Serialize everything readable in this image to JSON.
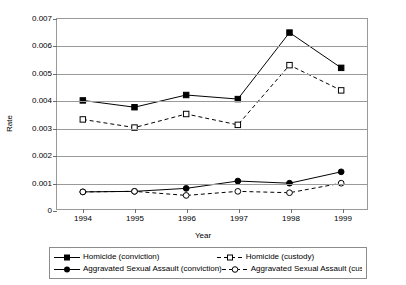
{
  "chart_data": {
    "type": "line",
    "title": "",
    "xlabel": "Year",
    "ylabel": "Rate",
    "x": [
      1994,
      1995,
      1996,
      1997,
      1998,
      1999
    ],
    "categories": [
      "1994",
      "1995",
      "1996",
      "1997",
      "1998",
      "1999"
    ],
    "ylim": [
      0,
      0.007
    ],
    "yticks": [
      0,
      0.001,
      0.002,
      0.003,
      0.004,
      0.005,
      0.006,
      0.007
    ],
    "ytick_labels": [
      "0",
      "0.001",
      "0.002",
      "0.003",
      "0.004",
      "0.005",
      "0.006",
      "0.007"
    ],
    "grid": true,
    "legend_position": "bottom",
    "series": [
      {
        "name": "Homicide (conviction)",
        "marker": "filled-square",
        "line": "solid",
        "color": "#000000",
        "values": [
          0.004,
          0.00375,
          0.0042,
          0.00405,
          0.0065,
          0.0052
        ]
      },
      {
        "name": "Homicide (custody)",
        "marker": "open-square",
        "line": "dashed",
        "color": "#000000",
        "values": [
          0.0033,
          0.003,
          0.0035,
          0.0031,
          0.0053,
          0.00437
        ]
      },
      {
        "name": "Aggravated Sexual Assault (conviction)",
        "marker": "filled-circle",
        "line": "solid",
        "color": "#000000",
        "values": [
          0.00063,
          0.00065,
          0.00076,
          0.00103,
          0.00095,
          0.00137
        ]
      },
      {
        "name": "Aggravated Sexual Assault (custody)",
        "marker": "open-circle",
        "line": "dashed",
        "color": "#000000",
        "values": [
          0.00063,
          0.00065,
          0.0005,
          0.00065,
          0.0006,
          0.00095
        ]
      }
    ]
  },
  "axes": {
    "y_title": "Rate",
    "x_title": "Year"
  },
  "legend": {
    "entries": [
      "Homicide (conviction)",
      "Homicide (custody)",
      "Aggravated Sexual Assault (conviction)",
      "Aggravated Sexual Assault (custody)"
    ]
  }
}
